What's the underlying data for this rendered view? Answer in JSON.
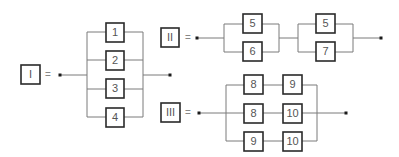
{
  "diagram": {
    "title": "",
    "colors": {
      "wire": "#7a7a7a",
      "box_border": "#2a2a2a",
      "text": "#555555",
      "terminal": "#1a1a1a",
      "background": "#ffffff"
    },
    "systems": [
      {
        "id": "I",
        "label": "I",
        "equals": "=",
        "structure": "parallel",
        "branches": [
          [
            "1"
          ],
          [
            "2"
          ],
          [
            "3"
          ],
          [
            "4"
          ]
        ]
      },
      {
        "id": "II",
        "label": "II",
        "equals": "=",
        "structure": "series of parallel groups",
        "groups": [
          {
            "branches": [
              [
                "5"
              ],
              [
                "6"
              ]
            ]
          },
          {
            "branches": [
              [
                "5"
              ],
              [
                "7"
              ]
            ]
          }
        ]
      },
      {
        "id": "III",
        "label": "III",
        "equals": "=",
        "structure": "parallel of series paths",
        "branches": [
          [
            "8",
            "9"
          ],
          [
            "8",
            "10"
          ],
          [
            "9",
            "10"
          ]
        ]
      }
    ]
  }
}
